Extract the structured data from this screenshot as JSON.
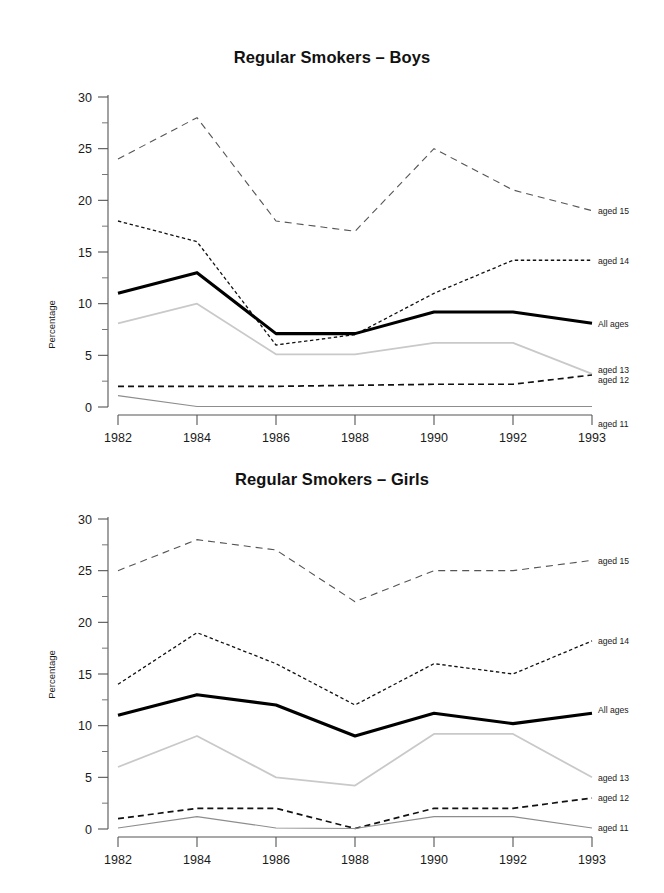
{
  "page": {
    "background": "#ffffff",
    "width": 664,
    "height": 893
  },
  "charts": [
    {
      "id": "boys",
      "title": "Regular Smokers – Boys",
      "ylabel": "Percentage"
    },
    {
      "id": "girls",
      "title": "Regular Smokers – Girls",
      "ylabel": "Percentage"
    }
  ],
  "chart_data": [
    {
      "type": "line",
      "title": "Regular Smokers – Boys",
      "xlabel": "",
      "ylabel": "Percentage",
      "categories": [
        "1982",
        "1984",
        "1986",
        "1988",
        "1990",
        "1992",
        "1993"
      ],
      "x": [
        1982,
        1984,
        1986,
        1988,
        1990,
        1992,
        1993
      ],
      "ylim": [
        0,
        30
      ],
      "yticks": [
        0,
        5,
        10,
        15,
        20,
        25,
        30
      ],
      "yminorticks": [
        2.5,
        7.5,
        12.5,
        17.5,
        22.5,
        27.5
      ],
      "grid": false,
      "legend_position": "right-inline",
      "series": [
        {
          "name": "aged 15",
          "values": [
            24,
            28,
            18,
            17,
            25,
            21,
            19
          ],
          "color": "#555555",
          "style": "dashed-long",
          "width": 1.1
        },
        {
          "name": "aged 14",
          "values": [
            18,
            16,
            6,
            7,
            11,
            14.2,
            14.2
          ],
          "color": "#111111",
          "style": "dashed-short",
          "width": 1.3
        },
        {
          "name": "All ages",
          "values": [
            11,
            13,
            7.1,
            7.1,
            9.2,
            9.2,
            8.1
          ],
          "color": "#000000",
          "style": "solid",
          "width": 3.1
        },
        {
          "name": "aged 13",
          "values": [
            8.1,
            10,
            5.1,
            5.1,
            6.2,
            6.2,
            3.2
          ],
          "color": "#c9c9c9",
          "style": "solid",
          "width": 1.8
        },
        {
          "name": "aged 12",
          "values": [
            2,
            2,
            2,
            2.1,
            2.2,
            2.2,
            3.1
          ],
          "color": "#111111",
          "style": "dashed-med",
          "width": 1.7
        },
        {
          "name": "aged 11",
          "values": [
            1.1,
            0.05,
            0.05,
            0.05,
            0.05,
            0.05,
            0.05
          ],
          "color": "#8d8d8d",
          "style": "solid",
          "width": 1.1
        }
      ]
    },
    {
      "type": "line",
      "title": "Regular Smokers – Girls",
      "xlabel": "",
      "ylabel": "Percentage",
      "categories": [
        "1982",
        "1984",
        "1986",
        "1988",
        "1990",
        "1992",
        "1993"
      ],
      "x": [
        1982,
        1984,
        1986,
        1988,
        1990,
        1992,
        1993
      ],
      "ylim": [
        0,
        30
      ],
      "yticks": [
        0,
        5,
        10,
        15,
        20,
        25,
        30
      ],
      "yminorticks": [
        2.5,
        7.5,
        12.5,
        17.5,
        22.5,
        27.5
      ],
      "grid": false,
      "legend_position": "right-inline",
      "series": [
        {
          "name": "aged 15",
          "values": [
            25,
            28,
            27,
            22,
            25,
            25,
            26
          ],
          "color": "#555555",
          "style": "dashed-long",
          "width": 1.1
        },
        {
          "name": "aged 14",
          "values": [
            14,
            19,
            16,
            12,
            16,
            15,
            18.2
          ],
          "color": "#111111",
          "style": "dashed-short",
          "width": 1.3
        },
        {
          "name": "All ages",
          "values": [
            11,
            13,
            12,
            9,
            11.2,
            10.2,
            11.2
          ],
          "color": "#000000",
          "style": "solid",
          "width": 3.1
        },
        {
          "name": "aged 13",
          "values": [
            6,
            9,
            5,
            4.2,
            9.2,
            9.2,
            5
          ],
          "color": "#c9c9c9",
          "style": "solid",
          "width": 1.8
        },
        {
          "name": "aged 12",
          "values": [
            1,
            2,
            2,
            0.05,
            2,
            2,
            3
          ],
          "color": "#111111",
          "style": "dashed-med",
          "width": 1.7
        },
        {
          "name": "aged 11",
          "values": [
            0.1,
            1.2,
            0.1,
            0.05,
            1.2,
            1.2,
            0.1
          ],
          "color": "#8d8d8d",
          "style": "solid",
          "width": 1.1
        }
      ]
    }
  ],
  "series_label_offsets": {
    "boys": {
      "aged 15": 0,
      "aged 14": 0,
      "All ages": 0,
      "aged 13": -4,
      "aged 12": 5,
      "aged 11": 17
    },
    "girls": {
      "aged 15": 0,
      "aged 14": 0,
      "All ages": -4,
      "aged 13": 0,
      "aged 12": 0,
      "aged 11": 0
    }
  }
}
